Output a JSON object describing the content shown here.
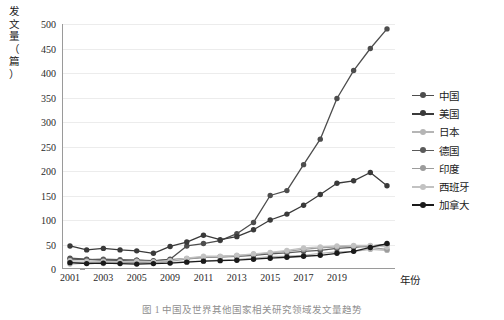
{
  "chart_data": {
    "type": "line",
    "title": "",
    "xlabel": "年份",
    "ylabel": "发文量（篇）",
    "ylim": [
      0,
      500
    ],
    "yticks": [
      0,
      50,
      100,
      150,
      200,
      250,
      300,
      350,
      400,
      450,
      500
    ],
    "grid": true,
    "legend_position": "right",
    "x": [
      2001,
      2002,
      2003,
      2004,
      2005,
      2006,
      2007,
      2008,
      2009,
      2010,
      2011,
      2012,
      2013,
      2014,
      2015,
      2016,
      2017,
      2018,
      2019,
      2020
    ],
    "xtick_labels": [
      "2001",
      "2003",
      "2005",
      "2009",
      "2011",
      "2013",
      "2015",
      "2017",
      "2019"
    ],
    "xtick_values": [
      2001,
      2003,
      2005,
      2007,
      2009,
      2011,
      2013,
      2015,
      2017
    ],
    "series": [
      {
        "name": "中国",
        "color": "#4d4d4d",
        "values": [
          22,
          20,
          17,
          17,
          18,
          16,
          20,
          47,
          52,
          58,
          72,
          95,
          150,
          160,
          213,
          265,
          348,
          405,
          450,
          490
        ]
      },
      {
        "name": "美国",
        "color": "#3a3a3a",
        "values": [
          47,
          39,
          42,
          39,
          37,
          32,
          46,
          55,
          69,
          60,
          66,
          80,
          100,
          112,
          130,
          152,
          175,
          180,
          197,
          170
        ]
      },
      {
        "name": "日本",
        "color": "#b5b5b5",
        "values": [
          10,
          12,
          11,
          13,
          12,
          12,
          13,
          15,
          16,
          18,
          19,
          22,
          25,
          26,
          28,
          32,
          35,
          36,
          40,
          38
        ]
      },
      {
        "name": "德国",
        "color": "#5a5a5a",
        "values": [
          20,
          19,
          20,
          19,
          18,
          17,
          19,
          21,
          24,
          25,
          26,
          28,
          31,
          33,
          36,
          38,
          42,
          44,
          47,
          50
        ]
      },
      {
        "name": "印度",
        "color": "#9c9c9c",
        "values": [
          14,
          13,
          15,
          14,
          13,
          14,
          16,
          20,
          24,
          25,
          27,
          30,
          33,
          36,
          40,
          43,
          45,
          47,
          44,
          40
        ]
      },
      {
        "name": "西班牙",
        "color": "#c2c2c2",
        "values": [
          17,
          16,
          16,
          15,
          16,
          15,
          17,
          22,
          26,
          26,
          28,
          31,
          34,
          38,
          43,
          45,
          47,
          48,
          48,
          45
        ]
      },
      {
        "name": "加拿大",
        "color": "#1a1a1a",
        "values": [
          13,
          11,
          12,
          11,
          10,
          11,
          12,
          14,
          16,
          17,
          18,
          20,
          22,
          24,
          26,
          28,
          32,
          36,
          44,
          52
        ]
      }
    ]
  },
  "axes": {
    "y_title_chars": [
      "发",
      "文",
      "量",
      "（",
      "篇",
      "）"
    ],
    "x_title": "年份"
  },
  "caption": {
    "text": "图 1    中国及世界其他国家相关研究领域发文量趋势"
  }
}
